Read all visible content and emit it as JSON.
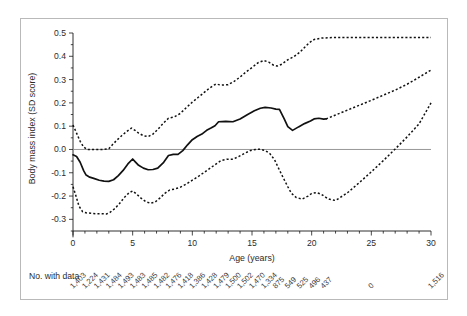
{
  "figure": {
    "caption_note": "No. with data",
    "counts_label_color": "#3a3a3a"
  },
  "chart_data": {
    "type": "line",
    "title": "",
    "xlabel": "Age (years)",
    "ylabel": "Body mass index (SD score)",
    "xlim": [
      0,
      30
    ],
    "ylim": [
      -0.35,
      0.5
    ],
    "grid": false,
    "legend_position": "none",
    "zero_reference_line": 0.0,
    "x_ticks": [
      0,
      5,
      10,
      15,
      20,
      25,
      30
    ],
    "x_tick_labels": [
      "0",
      "5",
      "10",
      "15",
      "20",
      "25",
      "30"
    ],
    "x_minor_tick_interval": 1,
    "y_ticks": [
      -0.3,
      -0.2,
      -0.1,
      0.0,
      0.1,
      0.2,
      0.3,
      0.4,
      0.5
    ],
    "y_tick_labels": [
      "-0.3",
      "-0.2",
      "-0.1",
      "0.0",
      "0.1",
      "0.2",
      "0.3",
      "0.4",
      "0.5"
    ],
    "series": [
      {
        "name": "Mean difference (solid)",
        "style": "solid",
        "color": "#111111",
        "x": [
          0,
          0.3,
          0.6,
          0.9,
          1.1,
          1.4,
          1.8,
          2.2,
          2.6,
          3.0,
          3.4,
          3.8,
          4.2,
          4.6,
          5.0,
          5.2,
          5.5,
          5.9,
          6.3,
          6.7,
          7.1,
          7.6,
          8.0,
          8.4,
          8.8,
          9.2,
          9.6,
          10.0,
          10.4,
          10.8,
          11.2,
          11.6,
          11.9,
          12.2,
          12.8,
          13.4,
          14.0,
          14.6,
          15.2,
          15.7,
          16.1,
          16.6,
          17.0,
          17.3,
          17.7,
          18.0,
          18.4,
          18.9,
          19.4,
          19.9,
          20.2,
          20.6,
          21.0,
          21.2
        ],
        "y": [
          -0.023,
          -0.03,
          -0.055,
          -0.092,
          -0.11,
          -0.119,
          -0.125,
          -0.132,
          -0.136,
          -0.137,
          -0.13,
          -0.112,
          -0.09,
          -0.062,
          -0.041,
          -0.052,
          -0.068,
          -0.08,
          -0.087,
          -0.086,
          -0.08,
          -0.055,
          -0.026,
          -0.021,
          -0.021,
          -0.005,
          0.02,
          0.042,
          0.056,
          0.066,
          0.082,
          0.093,
          0.102,
          0.119,
          0.121,
          0.119,
          0.131,
          0.149,
          0.166,
          0.177,
          0.181,
          0.178,
          0.173,
          0.172,
          0.131,
          0.098,
          0.082,
          0.097,
          0.111,
          0.122,
          0.131,
          0.134,
          0.13,
          0.131
        ]
      },
      {
        "name": "Upper 95% confidence limit (dashed)",
        "style": "dashed",
        "color": "#111111",
        "x": [
          0,
          0.3,
          0.6,
          0.9,
          1.2,
          1.5,
          2.0,
          2.5,
          3.0,
          3.3,
          3.7,
          4.1,
          4.5,
          4.9,
          5.2,
          5.5,
          5.9,
          6.3,
          6.7,
          7.1,
          7.6,
          8.0,
          8.5,
          9.0,
          9.5,
          10.0,
          10.5,
          11.0,
          11.4,
          11.8,
          12.0,
          12.4,
          13.0,
          13.5,
          14.0,
          14.5,
          15.0,
          15.5,
          16.0,
          16.4,
          16.8,
          17.1,
          17.5,
          18.0,
          18.5,
          19.0,
          19.4,
          19.8,
          20.2,
          20.8,
          21.5,
          22.5,
          24.0,
          26.0,
          28.0,
          30.0
        ],
        "y": [
          0.105,
          0.07,
          0.035,
          0.01,
          0.0,
          0.0,
          0.0,
          0.0,
          0.003,
          0.02,
          0.041,
          0.06,
          0.077,
          0.092,
          0.082,
          0.07,
          0.059,
          0.055,
          0.066,
          0.086,
          0.114,
          0.134,
          0.14,
          0.155,
          0.18,
          0.203,
          0.224,
          0.245,
          0.262,
          0.276,
          0.281,
          0.276,
          0.278,
          0.292,
          0.311,
          0.333,
          0.352,
          0.372,
          0.382,
          0.375,
          0.362,
          0.358,
          0.366,
          0.385,
          0.398,
          0.417,
          0.438,
          0.458,
          0.472,
          0.478,
          0.48,
          0.481,
          0.481,
          0.481,
          0.481,
          0.481
        ]
      },
      {
        "name": "Lower 95% confidence limit (dashed)",
        "style": "dashed",
        "color": "#111111",
        "x": [
          0,
          0.25,
          0.5,
          0.8,
          1.1,
          1.5,
          2.0,
          2.4,
          2.8,
          3.1,
          3.5,
          3.9,
          4.3,
          4.7,
          5.0,
          5.3,
          5.7,
          6.1,
          6.5,
          6.9,
          7.3,
          7.7,
          8.1,
          8.5,
          9.0,
          9.5,
          10.0,
          10.5,
          11.0,
          11.5,
          12.0,
          12.4,
          12.9,
          13.4,
          13.9,
          14.4,
          14.9,
          15.3,
          15.7,
          16.1,
          16.5,
          16.9,
          17.2,
          17.6,
          18.0,
          18.3,
          18.7,
          19.2,
          19.7,
          20.0,
          20.4,
          20.8,
          21.2,
          21.5,
          22.0,
          23.0,
          24.0,
          25.0,
          26.0,
          27.0,
          28.0,
          29.0,
          30.0
        ],
        "y": [
          -0.16,
          -0.2,
          -0.243,
          -0.267,
          -0.272,
          -0.274,
          -0.276,
          -0.276,
          -0.277,
          -0.27,
          -0.254,
          -0.232,
          -0.206,
          -0.186,
          -0.178,
          -0.19,
          -0.209,
          -0.224,
          -0.231,
          -0.225,
          -0.208,
          -0.188,
          -0.174,
          -0.17,
          -0.162,
          -0.148,
          -0.132,
          -0.116,
          -0.098,
          -0.08,
          -0.062,
          -0.048,
          -0.042,
          -0.042,
          -0.03,
          -0.016,
          -0.004,
          0.0,
          0.001,
          -0.004,
          -0.018,
          -0.045,
          -0.078,
          -0.12,
          -0.16,
          -0.188,
          -0.206,
          -0.213,
          -0.2,
          -0.189,
          -0.185,
          -0.192,
          -0.206,
          -0.214,
          -0.219,
          -0.186,
          -0.142,
          -0.096,
          -0.048,
          0.002,
          0.054,
          0.11,
          0.2
        ]
      },
      {
        "name": "Mean difference extrapolated (dashed)",
        "style": "dashed",
        "color": "#111111",
        "x": [
          21.2,
          22.0,
          23.0,
          24.0,
          25.0,
          26.0,
          27.0,
          28.0,
          29.0,
          30.0
        ],
        "y": [
          0.131,
          0.148,
          0.169,
          0.19,
          0.211,
          0.233,
          0.255,
          0.28,
          0.31,
          0.341
        ]
      }
    ],
    "counts_row": {
      "header": "No. with data",
      "ages": [
        0,
        1,
        2,
        3,
        4,
        5,
        6,
        7,
        8,
        9,
        10,
        11,
        12,
        13,
        14,
        15,
        16,
        17,
        18,
        19,
        20,
        21,
        25,
        30
      ],
      "values": [
        "1,403",
        "1,224",
        "1,431",
        "1,484",
        "1,493",
        "1,483",
        "1,485",
        "1,482",
        "1,476",
        "1,418",
        "1,386",
        "1,428",
        "1,479",
        "1,500",
        "1,502",
        "1,470",
        "1,334",
        "875",
        "549",
        "525",
        "496",
        "437",
        "0",
        "1,516"
      ]
    }
  }
}
